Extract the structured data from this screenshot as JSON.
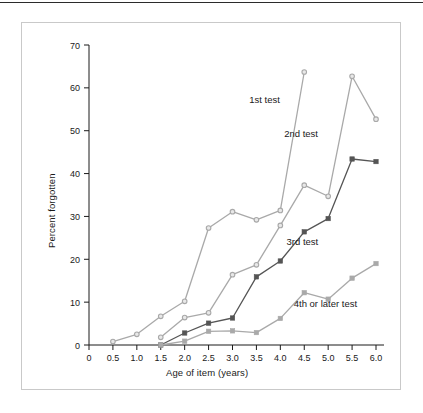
{
  "figure": {
    "axis_label_x": "Age of item (years)",
    "axis_label_y": "Percent forgotten"
  },
  "colors": {
    "light_series": "#a9a9a9",
    "dark_series": "#555555",
    "axis": "#1a1a1a",
    "frame": "#c9c9c9",
    "rule": "#2b2b2b",
    "background": "#ffffff"
  },
  "chart_data": {
    "type": "line",
    "title": "",
    "xlabel": "Age of item (years)",
    "ylabel": "Percent forgotten",
    "xlim": [
      0,
      6.0
    ],
    "ylim": [
      0,
      70
    ],
    "xticks": [
      "0",
      "0.5",
      "1.0",
      "1.5",
      "2.0",
      "2.5",
      "3.0",
      "3.5",
      "4.0",
      "4.5",
      "5.0",
      "5.5",
      "6.0"
    ],
    "yticks": [
      "0",
      "10",
      "20",
      "30",
      "40",
      "50",
      "60",
      "70"
    ],
    "grid": false,
    "legend": "inline-annotations",
    "series": [
      {
        "name": "1st test",
        "color": "#a9a9a9",
        "marker": "circle",
        "label_x": 3.35,
        "label_y": 56.5,
        "points": [
          {
            "x": 0.5,
            "y": 0.8
          },
          {
            "x": 1.0,
            "y": 2.5
          },
          {
            "x": 1.5,
            "y": 6.7
          },
          {
            "x": 2.0,
            "y": 10.2
          },
          {
            "x": 2.5,
            "y": 27.3
          },
          {
            "x": 3.0,
            "y": 31.1
          },
          {
            "x": 3.5,
            "y": 29.2
          },
          {
            "x": 4.0,
            "y": 31.4
          },
          {
            "x": 4.5,
            "y": 63.7
          }
        ]
      },
      {
        "name": "2nd test",
        "color": "#a9a9a9",
        "marker": "circle",
        "label_x": 4.08,
        "label_y": 48.6,
        "points": [
          {
            "x": 1.5,
            "y": 1.8
          },
          {
            "x": 2.0,
            "y": 6.4
          },
          {
            "x": 2.5,
            "y": 7.5
          },
          {
            "x": 3.0,
            "y": 16.4
          },
          {
            "x": 3.5,
            "y": 18.7
          },
          {
            "x": 4.0,
            "y": 27.9
          },
          {
            "x": 4.5,
            "y": 37.3
          },
          {
            "x": 5.0,
            "y": 34.7
          },
          {
            "x": 5.5,
            "y": 62.7
          },
          {
            "x": 6.0,
            "y": 52.7
          }
        ]
      },
      {
        "name": "3rd test",
        "color": "#555555",
        "marker": "square",
        "label_x": 4.13,
        "label_y": 23.3,
        "points": [
          {
            "x": 1.5,
            "y": 0.0
          },
          {
            "x": 2.0,
            "y": 2.8
          },
          {
            "x": 2.5,
            "y": 5.1
          },
          {
            "x": 3.0,
            "y": 6.3
          },
          {
            "x": 3.5,
            "y": 15.9
          },
          {
            "x": 4.0,
            "y": 19.6
          },
          {
            "x": 4.5,
            "y": 26.4
          },
          {
            "x": 5.0,
            "y": 29.5
          },
          {
            "x": 5.5,
            "y": 43.4
          },
          {
            "x": 6.0,
            "y": 42.8
          }
        ]
      },
      {
        "name": "4th or later test",
        "color": "#a9a9a9",
        "marker": "square",
        "label_x": 4.28,
        "label_y": 8.9,
        "points": [
          {
            "x": 1.5,
            "y": 0.0
          },
          {
            "x": 2.0,
            "y": 0.9
          },
          {
            "x": 2.5,
            "y": 3.2
          },
          {
            "x": 3.0,
            "y": 3.3
          },
          {
            "x": 3.5,
            "y": 2.9
          },
          {
            "x": 4.0,
            "y": 6.2
          },
          {
            "x": 4.5,
            "y": 12.2
          },
          {
            "x": 5.0,
            "y": 10.7
          },
          {
            "x": 5.5,
            "y": 15.6
          },
          {
            "x": 6.0,
            "y": 19.0
          }
        ]
      }
    ]
  }
}
